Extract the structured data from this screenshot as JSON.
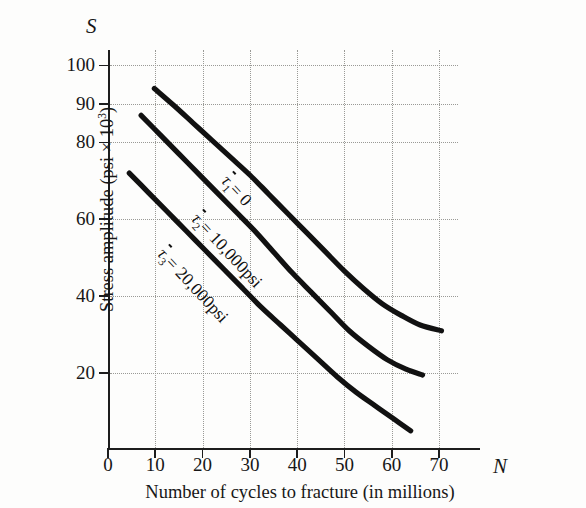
{
  "figure": {
    "y_symbol": "S",
    "x_symbol": "N"
  },
  "chart_data": {
    "type": "line",
    "title": "",
    "xlabel": "Number of cycles to fracture (in millions)",
    "ylabel": "Stress amplitude (psi × 10³)",
    "ylabel_main": "Stress amplitude (psi × 10",
    "ylabel_exp": "3",
    "ylabel_tail": ")",
    "xlim": [
      0,
      74
    ],
    "ylim": [
      0,
      104
    ],
    "grid": true,
    "legend_position": "inline-on-curve",
    "xticks": [
      0,
      10,
      20,
      30,
      40,
      50,
      60,
      70
    ],
    "xtick_labels": [
      "0",
      "10",
      "20",
      "30",
      "40",
      "50",
      "60",
      "70"
    ],
    "yticks": [
      20,
      40,
      60,
      80,
      90,
      100
    ],
    "ytick_labels": [
      "20",
      "40",
      "60",
      "80",
      "90",
      "100"
    ],
    "series": [
      {
        "name": "tau1",
        "label_tau": "τ",
        "label_sub": "1",
        "label_rest": "= 0",
        "label_full": "τ̄1 = 0",
        "x": [
          9.8,
          14,
          18,
          22,
          26,
          30,
          34,
          38,
          42,
          46,
          50,
          54,
          58,
          62,
          66,
          70.5
        ],
        "y": [
          94,
          89.5,
          85,
          80.5,
          76,
          71.5,
          66.5,
          61.5,
          56.5,
          51.5,
          46.5,
          42,
          38,
          35,
          32.5,
          31
        ]
      },
      {
        "name": "tau2",
        "label_tau": "τ",
        "label_sub": "2",
        "label_rest": "= 10,000psi",
        "label_full": "τ̄2 = 10,000psi",
        "x": [
          7,
          11,
          15,
          19,
          23,
          27,
          31,
          35,
          39,
          43,
          47,
          51,
          55,
          59,
          63,
          66.5
        ],
        "y": [
          87,
          82,
          77,
          72,
          67,
          62,
          57,
          51.5,
          46,
          41,
          36,
          31,
          27,
          23.5,
          21,
          19.5
        ]
      },
      {
        "name": "tau3",
        "label_tau": "τ",
        "label_sub": "3",
        "label_rest": "= 20,000psi",
        "label_full": "τ̄3 = 20,000psi",
        "x": [
          4.5,
          8.5,
          12.5,
          16.5,
          20.5,
          24.5,
          28.5,
          32.5,
          36.5,
          40.5,
          44.5,
          48.5,
          52.5,
          56.5,
          60.5,
          64
        ],
        "y": [
          72,
          67,
          62,
          57,
          52,
          47,
          42,
          37,
          32.5,
          28,
          23.5,
          19,
          15,
          11.5,
          8,
          5
        ]
      }
    ]
  },
  "annotations": [
    {
      "id": "note-tau1",
      "tau": "τ",
      "sub": "1",
      "rest": "= 0"
    },
    {
      "id": "note-tau2",
      "tau": "τ",
      "sub": "2",
      "rest": "= 10,000psi"
    },
    {
      "id": "note-tau3",
      "tau": "τ",
      "sub": "3",
      "rest": "= 20,000psi"
    }
  ]
}
